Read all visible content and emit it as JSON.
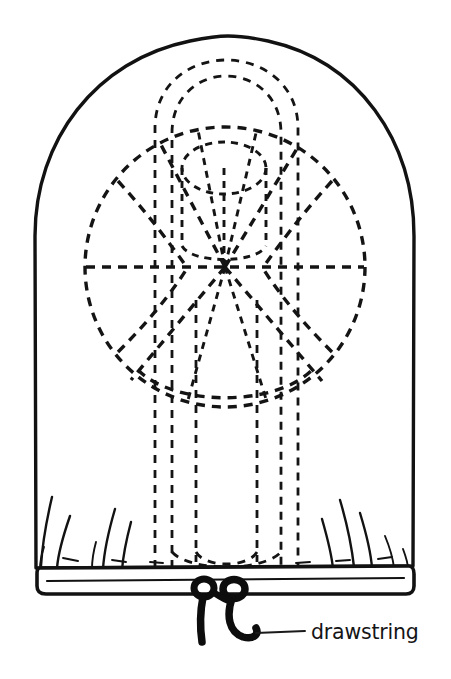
{
  "figure": {
    "background_color": "#ffffff",
    "ink_color": "#121212",
    "width": 451,
    "height": 679
  },
  "callouts": [
    {
      "id": "drawstring",
      "label": "drawstring",
      "label_x": 311,
      "label_y": 639,
      "leader_from_x": 256,
      "leader_from_y": 633,
      "leader_to_x": 305,
      "leader_to_y": 631
    }
  ],
  "parts": {
    "bag_outline_name": "bag-outline",
    "casing_name": "bottom-casing-band",
    "hidden_circle_name": "hidden-wheel-circle",
    "hidden_hub_name": "hidden-hub-cylinder",
    "hidden_handle_name": "hidden-inner-tube",
    "cord_name": "drawstring-cord",
    "gathers_name": "fabric-gathers"
  },
  "geometry": {
    "bag": {
      "left": 35,
      "right": 414,
      "top": 36,
      "bottom": 578,
      "crown_radius": 150
    },
    "casing": {
      "left": 38,
      "right": 410,
      "top": 566,
      "bottom": 594
    },
    "wheel_circle": {
      "cx": 225,
      "cy": 267,
      "r": 140
    },
    "hub": {
      "cx": 224,
      "cy": 168,
      "rx": 42,
      "ry": 26
    },
    "tube": {
      "outer_left": 155,
      "outer_right": 298,
      "inner_left": 172,
      "inner_right": 281,
      "top": 60,
      "bottom": 570
    },
    "cord_knot": {
      "left_x": 203,
      "right_x": 233,
      "y": 590
    }
  }
}
